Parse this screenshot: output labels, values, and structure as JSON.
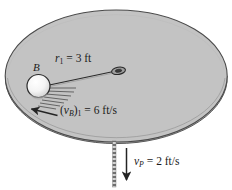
{
  "figure": {
    "name": "rotating-platform-with-ball-on-cord",
    "colors": {
      "disk_fill": "#c3c3c3",
      "disk_edge": "#4a4a4a",
      "disk_side": "#b0b0b0",
      "ball_fill": "#f2f2f2",
      "ball_shade": "#9a9a9a",
      "line": "#2b2b2b",
      "background": "#ffffff"
    },
    "labels": {
      "ball": "B",
      "radius_symbol": "r",
      "radius_subscript": "1",
      "radius_eq": "= 3 ft",
      "ball_speed_symbol": "v",
      "ball_speed_sub_body": "B",
      "ball_speed_sub_index": "1",
      "ball_speed_eq": "= 6 ft/s",
      "platform_speed_symbol": "v",
      "platform_speed_sub": "P",
      "platform_speed_eq": "= 2 ft/s"
    },
    "values": {
      "r1_ft": 3,
      "vB1_ft_per_s": 6,
      "vP_ft_per_s": 2
    },
    "icons": {
      "ball": "sphere-icon",
      "eyelet": "ring-icon",
      "cord": "cord-line-icon",
      "velocity_arrow_ball": "arrow-left-icon",
      "velocity_arrow_platform": "arrow-down-icon",
      "axis": "dashed-axis-icon",
      "hatching": "hatch-lines-icon"
    }
  }
}
